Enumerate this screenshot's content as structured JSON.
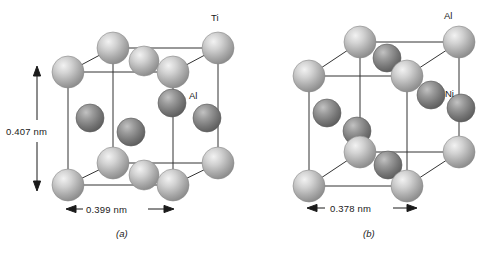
{
  "figure": {
    "panels": [
      {
        "id": "a",
        "caption": "(a)",
        "labels": {
          "corner_atom": "Ti",
          "interior_atom": "Al"
        },
        "dimensions": {
          "height": "0.407 nm",
          "width": "0.399 nm"
        },
        "colors": {
          "light_atom": "#b0b0b0",
          "light_atom_highlight": "#e8e8e8",
          "dark_atom": "#7a7a7a",
          "dark_atom_highlight": "#b8b8b8",
          "edge": "#2b2b2b"
        },
        "light_atoms": [
          {
            "cx": 113,
            "cy": 48,
            "r": 16
          },
          {
            "cx": 68,
            "cy": 72,
            "r": 16
          },
          {
            "cx": 218,
            "cy": 48,
            "r": 16
          },
          {
            "cx": 173,
            "cy": 72,
            "r": 16
          },
          {
            "cx": 113,
            "cy": 163,
            "r": 16
          },
          {
            "cx": 68,
            "cy": 185,
            "r": 16
          },
          {
            "cx": 218,
            "cy": 163,
            "r": 16
          },
          {
            "cx": 173,
            "cy": 185,
            "r": 16
          },
          {
            "cx": 144,
            "cy": 61,
            "r": 15
          },
          {
            "cx": 144,
            "cy": 175,
            "r": 15
          }
        ],
        "dark_atoms": [
          {
            "cx": 90,
            "cy": 118,
            "r": 14
          },
          {
            "cx": 131,
            "cy": 132,
            "r": 14
          },
          {
            "cx": 172,
            "cy": 103,
            "r": 14
          },
          {
            "cx": 207,
            "cy": 118,
            "r": 14
          }
        ]
      },
      {
        "id": "b",
        "caption": "(b)",
        "labels": {
          "corner_atom": "Al",
          "interior_atom": "Ni"
        },
        "dimensions": {
          "width": "0.378 nm"
        },
        "colors": {
          "light_atom": "#b0b0b0",
          "light_atom_highlight": "#e8e8e8",
          "dark_atom": "#7a7a7a",
          "dark_atom_highlight": "#b8b8b8",
          "edge": "#2b2b2b"
        },
        "light_atoms": [
          {
            "cx": 113,
            "cy": 42,
            "r": 16
          },
          {
            "cx": 62,
            "cy": 76,
            "r": 16
          },
          {
            "cx": 212,
            "cy": 42,
            "r": 16
          },
          {
            "cx": 160,
            "cy": 76,
            "r": 16
          },
          {
            "cx": 113,
            "cy": 152,
            "r": 16
          },
          {
            "cx": 62,
            "cy": 186,
            "r": 16
          },
          {
            "cx": 212,
            "cy": 152,
            "r": 16
          },
          {
            "cx": 160,
            "cy": 186,
            "r": 16
          }
        ],
        "dark_atoms": [
          {
            "cx": 140,
            "cy": 58,
            "r": 14
          },
          {
            "cx": 184,
            "cy": 95,
            "r": 14
          },
          {
            "cx": 214,
            "cy": 108,
            "r": 14
          },
          {
            "cx": 80,
            "cy": 113,
            "r": 14
          },
          {
            "cx": 110,
            "cy": 131,
            "r": 14
          },
          {
            "cx": 141,
            "cy": 165,
            "r": 14
          }
        ]
      }
    ]
  }
}
